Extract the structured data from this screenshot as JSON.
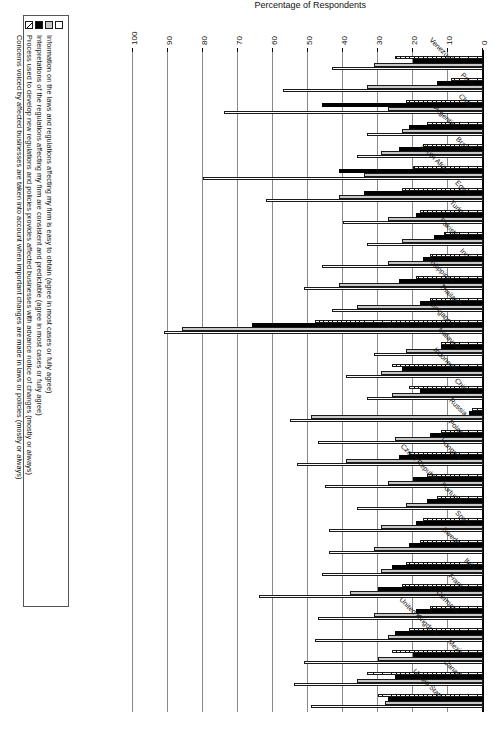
{
  "chart_data": {
    "type": "bar",
    "orientation": "horizontal-grouped",
    "title": "",
    "xlabel": "",
    "ylabel": "Percentage of Respondents",
    "ylim": [
      0,
      100
    ],
    "ytick_labels": [
      "0",
      "10",
      "20",
      "30",
      "40",
      "50",
      "60",
      "70",
      "80",
      "90",
      "100"
    ],
    "ytick_values": [
      0,
      10,
      20,
      30,
      40,
      50,
      60,
      70,
      80,
      90,
      100
    ],
    "grid": true,
    "legend_position": "right",
    "categories": [
      "United States",
      "Canada",
      "Mexico",
      "United Kingdom",
      "Germany",
      "France",
      "Italy",
      "Sweden",
      "Spain",
      "Portugal",
      "Czech Republic",
      "Hungary",
      "Poland",
      "Russia",
      "China",
      "Indonesia",
      "Malaysia",
      "Singapore",
      "Thailand",
      "Philippines",
      "India",
      "Pakistan",
      "Turkey",
      "Egypt",
      "South Africa",
      "Brazil",
      "Argentina",
      "Chile",
      "Peru",
      "Venezuela"
    ],
    "series": [
      {
        "name": "Information on the laws and regulations affecting my firm is easy to obtain (agree in most cases or fully agree)",
        "key": "information",
        "swatch": "white-open",
        "values": [
          49,
          54,
          51,
          48,
          47,
          64,
          46,
          44,
          44,
          36,
          45,
          53,
          47,
          55,
          33,
          39,
          31,
          91,
          43,
          51,
          46,
          33,
          40,
          62,
          80,
          36,
          33,
          74,
          57,
          43
        ]
      },
      {
        "name": "Interpretations of the regulations affecting my firm are consistent and predictable (agree in most cases or fully agree)",
        "key": "interpretations",
        "swatch": "light-gray",
        "values": [
          28,
          36,
          30,
          27,
          31,
          38,
          29,
          31,
          29,
          22,
          27,
          39,
          25,
          49,
          26,
          29,
          22,
          86,
          36,
          41,
          27,
          23,
          27,
          41,
          34,
          29,
          23,
          27,
          33,
          31
        ]
      },
      {
        "name": "Process used to develop new regulations and policies provides affected businesses with advance notice of changes (mostly or always)",
        "key": "advance_notice",
        "swatch": "black",
        "values": [
          27,
          25,
          20,
          25,
          19,
          30,
          26,
          21,
          19,
          16,
          20,
          24,
          15,
          4,
          18,
          23,
          12,
          66,
          18,
          24,
          17,
          14,
          19,
          34,
          41,
          24,
          21,
          46,
          13,
          20
        ]
      },
      {
        "name": "Concerns voiced by affected businesses are taken into account when important changes are made in laws or policies (mostly or always)",
        "key": "concerns_voiced",
        "swatch": "hatched",
        "values": [
          30,
          33,
          26,
          21,
          15,
          23,
          22,
          18,
          17,
          13,
          16,
          21,
          12,
          3,
          21,
          26,
          12,
          48,
          15,
          19,
          15,
          11,
          18,
          23,
          20,
          17,
          16,
          22,
          9,
          25
        ]
      }
    ]
  },
  "axis": {
    "title": "Percentage of Respondents"
  },
  "legend": {
    "items": [
      {
        "label": "Information on the laws and regulations affecting my firm is easy to obtain (agree in most cases or fully agree)"
      },
      {
        "label": "Interpretations of the regulations affecting my firm are consistent and predictable (agree in most cases or fully agree)"
      },
      {
        "label": "Process used to develop new regulations and policies provides affected businesses with advance notice of changes (mostly or always)"
      },
      {
        "label": "Concerns voiced by affected businesses are taken into account when important changes are made in laws or policies (mostly or always)"
      }
    ]
  }
}
